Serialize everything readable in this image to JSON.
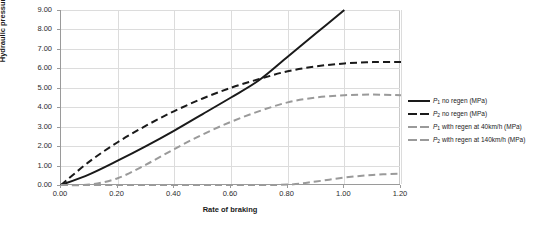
{
  "chart_data": {
    "type": "line",
    "title": "",
    "xlabel": "Rate of braking",
    "ylabel": "Hydraulic pressure (MPa)",
    "xlim": [
      0.0,
      1.2
    ],
    "ylim": [
      0.0,
      9.0
    ],
    "xticks": [
      "0.00",
      "0.20",
      "0.40",
      "0.60",
      "0.80",
      "1.00",
      "1.20"
    ],
    "yticks": [
      "0.00",
      "1.00",
      "2.00",
      "3.00",
      "4.00",
      "5.00",
      "6.00",
      "7.00",
      "8.00",
      "9.00"
    ],
    "grid": true,
    "legend_position": "right",
    "series": [
      {
        "name": "P1 no regen (MPa)",
        "label_main": "P",
        "label_sub": "1",
        "label_rest": " no regen (MPa)",
        "color": "#1a1a1a",
        "style": "solid",
        "x": [
          0.0,
          0.1,
          0.2,
          0.3,
          0.4,
          0.5,
          0.6,
          0.7,
          0.8,
          0.9,
          1.0
        ],
        "y": [
          0.0,
          0.55,
          1.25,
          2.0,
          2.8,
          3.65,
          4.5,
          5.4,
          6.6,
          7.8,
          9.0
        ]
      },
      {
        "name": "P2 no regen (MPa)",
        "label_main": "P",
        "label_sub": "2",
        "label_rest": " no regen (MPa)",
        "color": "#1a1a1a",
        "style": "dashed",
        "x": [
          0.0,
          0.1,
          0.2,
          0.3,
          0.4,
          0.5,
          0.6,
          0.7,
          0.8,
          0.9,
          1.0,
          1.1,
          1.2
        ],
        "y": [
          0.0,
          1.2,
          2.2,
          3.05,
          3.8,
          4.45,
          5.0,
          5.45,
          5.85,
          6.1,
          6.25,
          6.32,
          6.33
        ]
      },
      {
        "name": "P1 with regen at 40km/h (MPa)",
        "label_main": "P",
        "label_sub": "1",
        "label_rest": " with regen at 40km/h (MPa)",
        "color": "#9a9a9a",
        "style": "dashed",
        "x": [
          0.0,
          0.1,
          0.2,
          0.3,
          0.4,
          0.5,
          0.6,
          0.7,
          0.8,
          0.9,
          1.0,
          1.1,
          1.2
        ],
        "y": [
          0.0,
          0.02,
          0.35,
          1.05,
          1.85,
          2.6,
          3.25,
          3.8,
          4.25,
          4.5,
          4.62,
          4.65,
          4.62
        ]
      },
      {
        "name": "P2 with regen at 140km/h (MPa)",
        "label_main": "P",
        "label_sub": "2",
        "label_rest": " with regen at 140km/h (MPa)",
        "color": "#9a9a9a",
        "style": "dashed",
        "x": [
          0.0,
          0.2,
          0.4,
          0.6,
          0.8,
          0.9,
          1.0,
          1.1,
          1.2
        ],
        "y": [
          0.0,
          0.0,
          0.0,
          0.0,
          0.02,
          0.18,
          0.38,
          0.52,
          0.58
        ]
      }
    ]
  }
}
